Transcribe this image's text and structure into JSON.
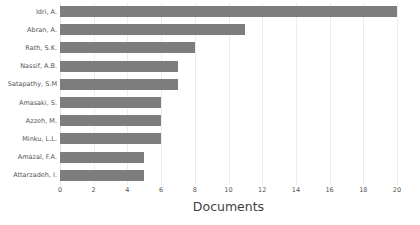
{
  "chart_data": {
    "type": "bar",
    "orientation": "horizontal",
    "title": "",
    "subtitle": "",
    "xlabel": "Documents",
    "ylabel": "",
    "categories": [
      "Idri, A.",
      "Abran, A.",
      "Rath, S.K.",
      "Nassif, A.B.",
      "Satapathy, S.M",
      "Amasaki, S.",
      "Azzeh, M.",
      "Minku, L.L.",
      "Amazal, F.A.",
      "Attarzadeh, I."
    ],
    "values": [
      20,
      11,
      8,
      7,
      7,
      6,
      6,
      6,
      5,
      5
    ],
    "xlim": [
      0,
      20
    ],
    "xticks": [
      0,
      2,
      4,
      6,
      8,
      10,
      12,
      14,
      16,
      18,
      20
    ],
    "xtick_labels": [
      "0",
      "2",
      "4",
      "6",
      "8",
      "10",
      "12",
      "14",
      "16",
      "18",
      "20"
    ],
    "grid": true,
    "grid_axis": "x",
    "legend": false,
    "bar_color": "#7d7d7d",
    "gridline_color": "#ededed",
    "axis_text_color": "#555555",
    "axis_title_color": "#3f3f3f",
    "background_color": "#ffffff"
  }
}
